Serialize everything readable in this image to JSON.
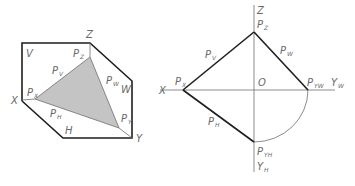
{
  "colors": {
    "thick_line": "#1e1e1e",
    "thin_line": "#6e6e6e",
    "fill": "#c4c4c4",
    "label": "#6a6a6a",
    "background": "#ffffff"
  },
  "left_figure": {
    "title": "Trace triangle of plane P in axonometric projection",
    "axis_labels": {
      "x": "X",
      "y": "Y",
      "z": "Z"
    },
    "plane_labels": {
      "v": "V",
      "w": "W",
      "h": "H"
    },
    "points": {
      "px": {
        "main": "P",
        "sub": "X"
      },
      "pz": {
        "main": "P",
        "sub": "Z"
      },
      "py": {
        "main": "P",
        "sub": "Y"
      }
    },
    "traces": {
      "pv": {
        "main": "P",
        "sub": "V"
      },
      "pw": {
        "main": "P",
        "sub": "W"
      },
      "ph": {
        "main": "P",
        "sub": "H"
      }
    }
  },
  "right_figure": {
    "title": "Traces of plane P in orthographic projection",
    "axis_labels": {
      "x": "X",
      "z": "Z",
      "origin": "O",
      "yw": {
        "main": "Y",
        "sub": "W"
      },
      "yh": {
        "main": "Y",
        "sub": "H"
      }
    },
    "points": {
      "px": {
        "main": "P",
        "sub": "X"
      },
      "pz": {
        "main": "P",
        "sub": "Z"
      },
      "pyw": {
        "main": "P",
        "sub": "YW"
      },
      "pyh": {
        "main": "P",
        "sub": "YH"
      }
    },
    "traces": {
      "pv": {
        "main": "P",
        "sub": "V"
      },
      "pw": {
        "main": "P",
        "sub": "W"
      },
      "ph": {
        "main": "P",
        "sub": "H"
      }
    }
  }
}
